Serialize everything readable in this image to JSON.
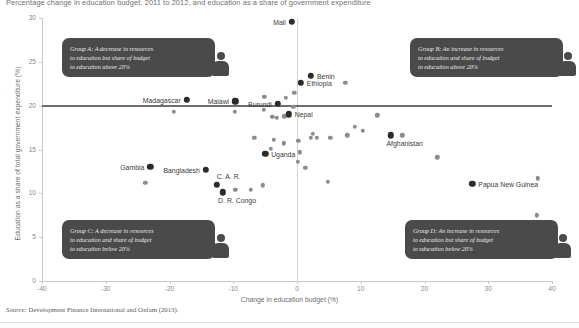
{
  "title": "Percentage change in education budget, 2011 to 2012, and education as a share of government expenditure",
  "source": {
    "prefix": "Source:",
    "text": " Development Finance International and Oxfam (2013)."
  },
  "callouts": [
    {
      "id": "group-a",
      "text": "Group A: A decrease in resources\nto education but share of budget\nto education above 20%"
    },
    {
      "id": "group-b",
      "text": "Group B: An increase in resources\nto education and share of budget\nto education above 20%"
    },
    {
      "id": "group-c",
      "text": "Group C: A decrease in resources\nto education and share of budget\nto education below  20%"
    },
    {
      "id": "group-d",
      "text": "Group D: An increase in resources\nto education but share of budget\nto education below  20%"
    }
  ],
  "chart_data": {
    "type": "scatter",
    "title": "Percentage change in education budget, 2011 to 2012, and education as a share of government expenditure",
    "xlabel": "Change in education budget (%)",
    "ylabel": "Education as a share of total government expenditure (%)",
    "xlim": [
      -40,
      40
    ],
    "ylim": [
      0,
      30
    ],
    "xticks": [
      -40,
      -30,
      -20,
      -10,
      0,
      10,
      20,
      30,
      40
    ],
    "yticks": [
      0,
      5,
      10,
      15,
      20,
      25,
      30
    ],
    "grid": false,
    "legend": "none",
    "reference_lines": [
      {
        "type": "horizontal",
        "value": 20,
        "color": "#6d6d6d"
      },
      {
        "type": "vertical",
        "value": 0,
        "color": "#d3d3d3"
      }
    ],
    "labeled_points": [
      {
        "label": "Mali",
        "x": -0.8,
        "y": 29.6,
        "label_pos": "left"
      },
      {
        "label": "Madagascar",
        "x": -17.3,
        "y": 20.7,
        "label_pos": "left"
      },
      {
        "label": "Malawi",
        "x": -9.7,
        "y": 20.5,
        "label_pos": "left"
      },
      {
        "label": "Burundi",
        "x": -3.0,
        "y": 20.2,
        "label_pos": "left"
      },
      {
        "label": "Nepal",
        "x": -1.3,
        "y": 19.0,
        "label_pos": "right"
      },
      {
        "label": "Benin",
        "x": 2.2,
        "y": 23.4,
        "label_pos": "right"
      },
      {
        "label": "Ethiopia",
        "x": 0.6,
        "y": 22.6,
        "label_pos": "right"
      },
      {
        "label": "Uganda",
        "x": -5.0,
        "y": 14.5,
        "label_pos": "right"
      },
      {
        "label": "Gambia",
        "x": -23.0,
        "y": 13.0,
        "label_pos": "left"
      },
      {
        "label": "Bangladesh",
        "x": -14.3,
        "y": 12.7,
        "label_pos": "left"
      },
      {
        "label": "C. A. R.",
        "x": -12.6,
        "y": 11.0,
        "label_pos": "above"
      },
      {
        "label": "D. R. Congo",
        "x": -11.6,
        "y": 10.1,
        "label_pos": "below"
      },
      {
        "label": "Afghanistan",
        "x": 14.7,
        "y": 16.6,
        "label_pos": "below"
      },
      {
        "label": "Papua New Guinea",
        "x": 27.5,
        "y": 11.1,
        "label_pos": "right"
      }
    ],
    "unlabeled_points": [
      {
        "x": -19.3,
        "y": 19.3
      },
      {
        "x": -9.8,
        "y": 19.3
      },
      {
        "x": -23.8,
        "y": 11.2
      },
      {
        "x": -5.1,
        "y": 21.0
      },
      {
        "x": -5.2,
        "y": 19.5
      },
      {
        "x": -3.9,
        "y": 18.7
      },
      {
        "x": -3.2,
        "y": 18.6
      },
      {
        "x": -2.0,
        "y": 18.8
      },
      {
        "x": -6.7,
        "y": 16.3
      },
      {
        "x": -3.6,
        "y": 16.1
      },
      {
        "x": -2.1,
        "y": 15.7
      },
      {
        "x": -4.1,
        "y": 15.1
      },
      {
        "x": -9.7,
        "y": 10.4
      },
      {
        "x": -7.2,
        "y": 10.4
      },
      {
        "x": -5.4,
        "y": 10.9
      },
      {
        "x": -1.8,
        "y": 20.9
      },
      {
        "x": -0.4,
        "y": 21.5
      },
      {
        "x": -0.6,
        "y": 19.9
      },
      {
        "x": 0.2,
        "y": 16.0
      },
      {
        "x": 0.4,
        "y": 14.7
      },
      {
        "x": 0.1,
        "y": 13.6
      },
      {
        "x": 1.3,
        "y": 12.9
      },
      {
        "x": 7.6,
        "y": 22.6
      },
      {
        "x": 12.6,
        "y": 18.9
      },
      {
        "x": 9.1,
        "y": 17.6
      },
      {
        "x": 10.3,
        "y": 17.1
      },
      {
        "x": 2.5,
        "y": 16.8
      },
      {
        "x": 2.2,
        "y": 16.3
      },
      {
        "x": 3.1,
        "y": 16.3
      },
      {
        "x": 7.9,
        "y": 16.6
      },
      {
        "x": 5.2,
        "y": 16.3
      },
      {
        "x": 16.5,
        "y": 16.6
      },
      {
        "x": 22.0,
        "y": 14.1
      },
      {
        "x": 4.8,
        "y": 11.3
      },
      {
        "x": 37.8,
        "y": 11.7
      },
      {
        "x": 37.6,
        "y": 7.5
      }
    ]
  }
}
